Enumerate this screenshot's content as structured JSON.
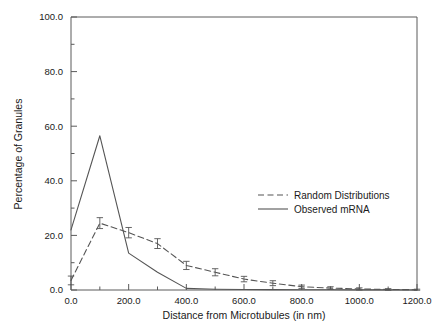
{
  "chart_data": {
    "type": "line",
    "title": "",
    "xlabel": "Distance from Microtubules (in nm)",
    "ylabel": "Percentage of Granules",
    "xlim": [
      0,
      1200
    ],
    "ylim": [
      0,
      100
    ],
    "xticks": [
      0,
      200,
      400,
      600,
      800,
      1000,
      1200
    ],
    "xtick_labels": [
      "0.0",
      "200.0",
      "400.0",
      "600.0",
      "800.0",
      "1000.0",
      "1200.0"
    ],
    "yticks": [
      0,
      20,
      40,
      60,
      80,
      100
    ],
    "ytick_labels": [
      "0.0",
      "20.0",
      "40.0",
      "60.0",
      "80.0",
      "100.0"
    ],
    "x_minor_step": 100,
    "y_minor_step": 10,
    "grid": false,
    "legend_position": "center-right",
    "x": [
      0,
      100,
      200,
      300,
      400,
      500,
      600,
      700,
      800,
      900,
      1000,
      1100,
      1200
    ],
    "series": [
      {
        "name": "Random Distributions",
        "style": "dashed",
        "color": "#555555",
        "has_error_bars": true,
        "values": [
          3.5,
          24.5,
          21.0,
          17.0,
          9.0,
          6.5,
          4.0,
          2.5,
          1.2,
          0.7,
          0.4,
          0.2,
          0.1
        ],
        "errors": [
          1.6,
          2.0,
          1.9,
          1.8,
          1.5,
          1.3,
          1.0,
          0.9,
          0.6,
          0.5,
          0.4,
          0.3,
          0.2
        ]
      },
      {
        "name": "Observed mRNA",
        "style": "solid",
        "color": "#555555",
        "has_error_bars": false,
        "values": [
          22.0,
          56.5,
          13.5,
          6.5,
          0.6,
          0.3,
          0.2,
          0.15,
          0.1,
          0.1,
          0.05,
          0.05,
          0.0
        ]
      }
    ]
  },
  "legend": {
    "entries": [
      {
        "label": "Random Distributions"
      },
      {
        "label": "Observed mRNA"
      }
    ]
  }
}
